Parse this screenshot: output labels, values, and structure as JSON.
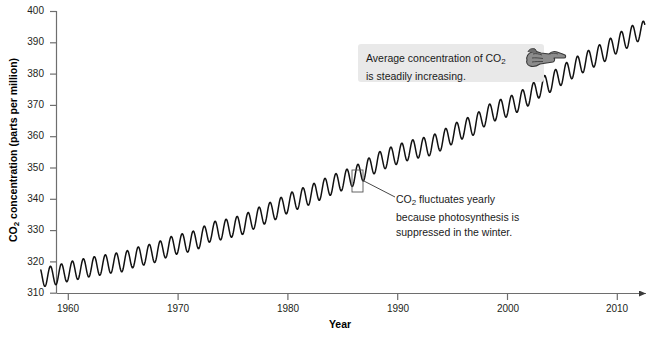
{
  "chart_data": {
    "type": "line",
    "title": "",
    "xlabel": "Year",
    "ylabel": "CO2 concentration (parts per million)",
    "ylabel_rich": "CO₂ concentration (parts per million)",
    "xlim": [
      1957.5,
      2012.5
    ],
    "ylim": [
      310,
      400
    ],
    "xticks": [
      1960,
      1970,
      1980,
      1990,
      2000,
      2010
    ],
    "yticks": [
      310,
      320,
      330,
      340,
      350,
      360,
      370,
      380,
      390,
      400
    ],
    "grid": false,
    "legend": null,
    "series": [
      {
        "name": "Atmospheric CO2 (Mauna Loa, monthly)",
        "description": "Rising trend with annual seasonal oscillation of about 6 ppm peak-to-trough",
        "seasonal_amplitude_ppm": 3.1,
        "x": [
          1958,
          1959,
          1960,
          1961,
          1962,
          1963,
          1964,
          1965,
          1966,
          1967,
          1968,
          1969,
          1970,
          1971,
          1972,
          1973,
          1974,
          1975,
          1976,
          1977,
          1978,
          1979,
          1980,
          1981,
          1982,
          1983,
          1984,
          1985,
          1986,
          1987,
          1988,
          1989,
          1990,
          1991,
          1992,
          1993,
          1994,
          1995,
          1996,
          1997,
          1998,
          1999,
          2000,
          2001,
          2002,
          2003,
          2004,
          2005,
          2006,
          2007,
          2008,
          2009,
          2010,
          2011,
          2012
        ],
        "values": [
          315.3,
          315.9,
          316.9,
          317.6,
          318.4,
          318.9,
          319.6,
          320.0,
          321.4,
          322.2,
          323.0,
          324.6,
          325.7,
          326.3,
          327.5,
          329.7,
          330.2,
          331.1,
          332.0,
          333.8,
          335.4,
          336.8,
          338.7,
          340.1,
          341.4,
          343.0,
          344.6,
          346.0,
          347.4,
          349.2,
          351.6,
          353.1,
          354.4,
          355.6,
          356.4,
          357.1,
          358.8,
          360.8,
          362.6,
          363.7,
          366.7,
          368.4,
          369.5,
          371.1,
          373.2,
          375.8,
          377.5,
          379.8,
          381.9,
          383.8,
          385.6,
          387.4,
          389.9,
          391.6,
          393.8
        ]
      }
    ],
    "annotations": [
      {
        "name": "average-increase-callout",
        "text_line1": "Average concentration of CO₂",
        "text_line2": "is steadily increasing.",
        "icon": "pointing-hand-icon",
        "box_color": "#e9e9e9"
      },
      {
        "name": "seasonal-fluctuation-note",
        "text_line1": "CO₂ fluctuates yearly",
        "text_line2": "because photosynthesis is",
        "text_line3": "suppressed in the winter.",
        "leader_line": true,
        "points_at_year": 1986
      }
    ],
    "colors": {
      "line": "#111111",
      "axis": "#6e6e6e",
      "text": "#1a1a1a",
      "callout_bg": "#e9e9e9"
    }
  },
  "axes": {
    "y_title": "CO2 concentration (parts per million)",
    "x_title": "Year",
    "y_tick_labels": [
      "400",
      "390",
      "380",
      "370",
      "360",
      "350",
      "340",
      "330",
      "320",
      "310"
    ],
    "x_tick_labels": [
      "1960",
      "1970",
      "1980",
      "1990",
      "2000",
      "2010"
    ]
  }
}
